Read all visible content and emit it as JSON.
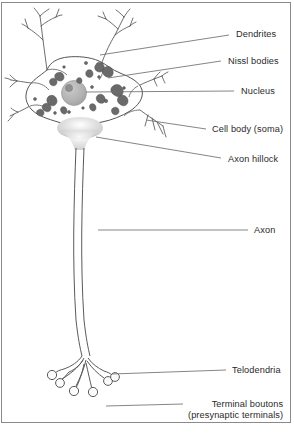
{
  "figure": {
    "background_color": "#ffffff",
    "frame_color": "#8a8a8a",
    "text_color": "#2a2a2a",
    "leader_line_color": "#6f6f6f",
    "outline_color": "#555555",
    "nucleus_color": "#b0b0b0",
    "nucleolus_color": "#8f8f8f",
    "nissl_color": "#6a6a6a",
    "hillock_color": "#d9d9d9"
  },
  "labels": [
    {
      "id": "dendrites",
      "text": "Dendrites",
      "text2": "",
      "x": 236,
      "y": 29,
      "leader": {
        "x1": 100,
        "y1": 55,
        "x2": 229,
        "y2": 35
      }
    },
    {
      "id": "nissl-bodies",
      "text": "Nissl bodies",
      "text2": "",
      "x": 228,
      "y": 56,
      "leader": {
        "x1": 108,
        "y1": 78,
        "x2": 221,
        "y2": 61
      }
    },
    {
      "id": "nucleus",
      "text": "Nucleus",
      "text2": "",
      "x": 241,
      "y": 86,
      "leader": {
        "x1": 86,
        "y1": 92,
        "x2": 234,
        "y2": 91
      }
    },
    {
      "id": "cell-body-soma",
      "text": "Cell body (soma)",
      "text2": "",
      "x": 212,
      "y": 124,
      "leader": {
        "x1": 146,
        "y1": 120,
        "x2": 206,
        "y2": 129
      }
    },
    {
      "id": "axon-hillock",
      "text": "Axon hillock",
      "text2": "",
      "x": 228,
      "y": 154,
      "leader": {
        "x1": 96,
        "y1": 137,
        "x2": 221,
        "y2": 158
      }
    },
    {
      "id": "axon",
      "text": "Axon",
      "text2": "",
      "x": 254,
      "y": 225,
      "leader": {
        "x1": 98,
        "y1": 230,
        "x2": 248,
        "y2": 230
      }
    },
    {
      "id": "telodendria",
      "text": "Telodendria",
      "text2": "",
      "x": 232,
      "y": 365,
      "leader": {
        "x1": 112,
        "y1": 374,
        "x2": 226,
        "y2": 370
      }
    },
    {
      "id": "terminal-boutons",
      "text": "Terminal boutons",
      "text2": "(presynaptic terminals)",
      "x": 188,
      "y": 399,
      "leader": {
        "x1": 106,
        "y1": 406,
        "x2": 183,
        "y2": 404
      }
    }
  ],
  "structures": {
    "dendrites_label": "Dendrites",
    "nissl_bodies_label": "Nissl bodies",
    "nucleus_label": "Nucleus",
    "soma_label": "Cell body (soma)",
    "axon_hillock_label": "Axon hillock",
    "axon_label": "Axon",
    "telodendria_label": "Telodendria",
    "terminal_boutons_label": "Terminal boutons",
    "terminal_boutons_sublabel": "(presynaptic terminals)"
  }
}
